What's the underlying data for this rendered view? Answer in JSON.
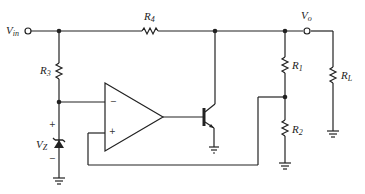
{
  "diagram": {
    "type": "circuit-schematic",
    "labels": {
      "vin": {
        "main": "V",
        "sub": "in"
      },
      "vo": {
        "main": "V",
        "sub": "o"
      },
      "r1": {
        "main": "R",
        "sub": "1"
      },
      "r2": {
        "main": "R",
        "sub": "2"
      },
      "r3": {
        "main": "R",
        "sub": "3"
      },
      "r4": {
        "main": "R",
        "sub": "4"
      },
      "rl": {
        "main": "R",
        "sub": "L"
      },
      "vz": {
        "main": "V",
        "sub": "Z"
      }
    },
    "opamp": {
      "inverting": "−",
      "noninverting": "+"
    },
    "zener_polarity": {
      "top": "+",
      "bottom": "−"
    },
    "colors": {
      "wire": "#222222",
      "background": "#ffffff"
    }
  }
}
